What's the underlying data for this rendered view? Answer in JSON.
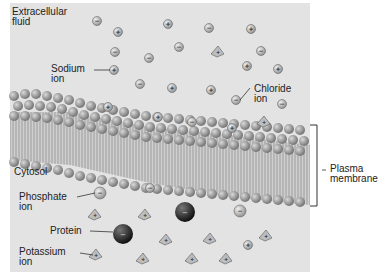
{
  "labels": {
    "extracellular": "Extracellular\nfluid",
    "sodium": "Sodium\nion",
    "chloride": "Chloride\nion",
    "cytosol": "Cytosol",
    "phosphate": "Phosphate\nion",
    "protein": "Protein",
    "potassium": "Potassium\nion",
    "plasma_membrane": "Plasma\nmembrane"
  },
  "symbols": {
    "plus": "+",
    "minus": "−"
  },
  "colors": {
    "panel": "#e3e3e3",
    "head": "#8a8a8a",
    "tail": "#b5b5b5",
    "protein": "#2a2a2a"
  }
}
